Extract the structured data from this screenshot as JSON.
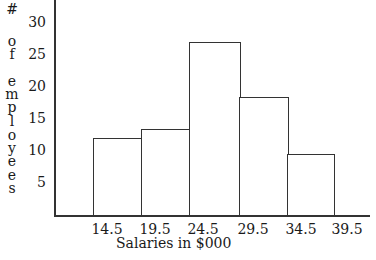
{
  "chart_data": {
    "type": "bar",
    "subtype": "histogram",
    "title": "",
    "xlabel": "Salaries in $000",
    "ylabel": "# of employees",
    "bin_edges": [
      14.5,
      19.5,
      24.5,
      29.5,
      34.5,
      39.5
    ],
    "categories": [
      "14.5-19.5",
      "19.5-24.5",
      "24.5-29.5",
      "29.5-34.5",
      "34.5-39.5"
    ],
    "values": [
      12,
      13.5,
      27,
      18.5,
      9.5
    ],
    "x_tick_labels": [
      "14.5",
      "19.5",
      "24.5",
      "29.5",
      "34.5",
      "39.5"
    ],
    "y_tick_labels": [
      "5",
      "10",
      "15",
      "20",
      "25",
      "30"
    ],
    "y_ticks": [
      5,
      10,
      15,
      20,
      25,
      30
    ],
    "ylim": [
      0,
      33
    ],
    "grid": false,
    "legend": null,
    "bar_fill": "#ffffff",
    "bar_edge": "#333333"
  },
  "ylabel_letters": [
    "#",
    "o",
    "f",
    "e",
    "m",
    "p",
    "l",
    "o",
    "y",
    "e",
    "e",
    "s"
  ]
}
